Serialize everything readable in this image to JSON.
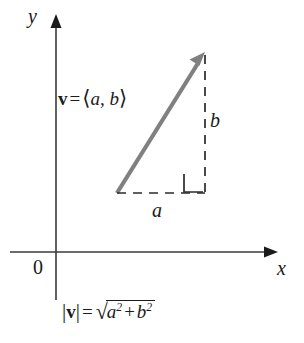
{
  "figure": {
    "type": "vector-diagram",
    "background_color": "#ffffff",
    "axis_color": "#3a3a3a",
    "vector_color": "#808080",
    "dash_color": "#2b2b2b",
    "text_color": "#1a1a1a"
  },
  "axes": {
    "y_label": "y",
    "x_label": "x",
    "origin_label": "0",
    "origin_px": {
      "x": 56,
      "y": 252
    },
    "x_axis": {
      "x_start": 10,
      "x_end": 272,
      "y": 252
    },
    "y_axis": {
      "x": 56,
      "y_start": 20,
      "y_end": 300
    }
  },
  "vector": {
    "label": {
      "name": "v",
      "equals": "=",
      "open_bracket": "⟨",
      "component_a": "a",
      "comma": ",",
      "component_b": "b",
      "close_bracket": "⟩"
    },
    "tail_px": {
      "x": 117,
      "y": 193
    },
    "tip_px": {
      "x": 205,
      "y": 52
    }
  },
  "components": {
    "horizontal_label": "a",
    "vertical_label": "b",
    "right_angle_marker": true,
    "corner_px": {
      "x": 205,
      "y": 193
    }
  },
  "magnitude": {
    "bar_left": "|",
    "vector_name": "v",
    "bar_right": "|",
    "equals": "=",
    "radical": "√",
    "term_a": "a",
    "exp_a": "2",
    "plus": "+",
    "term_b": "b",
    "exp_b": "2"
  }
}
